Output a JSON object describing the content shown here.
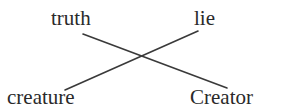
{
  "diagram": {
    "labels": {
      "top_left": "truth",
      "top_right": "lie",
      "bottom_left": "creature",
      "bottom_right": "Creator"
    },
    "connections": [
      {
        "from": "truth",
        "to": "Creator"
      },
      {
        "from": "creature",
        "to": "lie"
      }
    ],
    "line_color": "#3a3a3a",
    "text_color": "#2a2a2a"
  }
}
